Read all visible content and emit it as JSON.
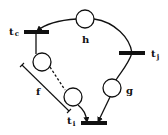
{
  "diagram": {
    "type": "petri-net",
    "places": [
      {
        "id": "h",
        "label": "h"
      },
      {
        "id": "g",
        "label": "g"
      },
      {
        "id": "f_start",
        "label": ""
      },
      {
        "id": "f_end",
        "label": ""
      }
    ],
    "transitions": [
      {
        "id": "t_c",
        "label": "t",
        "subscript": "c"
      },
      {
        "id": "t_j",
        "label": "t",
        "subscript": "j"
      },
      {
        "id": "t_i",
        "label": "t",
        "subscript": "i"
      }
    ],
    "arcs": [
      {
        "from": "h",
        "to": "t_c",
        "style": "solid"
      },
      {
        "from": "t_j",
        "to": "h",
        "style": "solid"
      },
      {
        "from": "t_j",
        "to": "g",
        "style": "solid"
      },
      {
        "from": "g",
        "to": "t_i",
        "style": "solid"
      },
      {
        "from": "t_c",
        "to": "f_start",
        "style": "solid"
      },
      {
        "from": "f_start",
        "to": "f_end",
        "style": "dashed"
      },
      {
        "from": "f_end",
        "to": "t_i",
        "style": "solid"
      }
    ],
    "bracket_label": "f",
    "colors": {
      "ink": "#111111",
      "background": "#ffffff"
    }
  }
}
